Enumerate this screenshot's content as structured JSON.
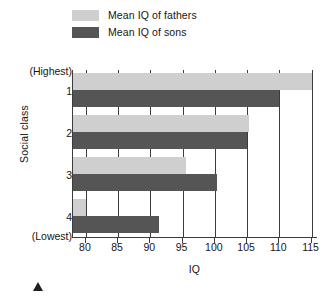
{
  "chart_data": {
    "type": "bar",
    "orientation": "horizontal",
    "title": "",
    "xlabel": "IQ",
    "ylabel": "Social class",
    "xlim": [
      78,
      116
    ],
    "xticks": [
      80,
      85,
      90,
      95,
      100,
      105,
      110,
      115
    ],
    "grid": true,
    "grid_axis": "x",
    "legend_position": "top-left",
    "categories": [
      "1",
      "2",
      "3",
      "4"
    ],
    "category_extra_labels": {
      "top": "(Highest)",
      "bottom": "(Lowest)"
    },
    "series": [
      {
        "name": "Mean IQ of fathers",
        "color": "#cfcfcf",
        "values": [
          115.0,
          105.3,
          95.5,
          80.0
        ]
      },
      {
        "name": "Mean IQ of sons",
        "color": "#555555",
        "values": [
          110.0,
          105.0,
          100.4,
          91.3
        ]
      }
    ]
  },
  "legend": {
    "items": [
      {
        "label": "Mean IQ of fathers",
        "color": "#cfcfcf"
      },
      {
        "label": "Mean IQ of sons",
        "color": "#555555"
      }
    ]
  },
  "axes": {
    "x": {
      "title": "IQ",
      "ticks": [
        "80",
        "85",
        "90",
        "95",
        "100",
        "105",
        "110",
        "115"
      ]
    },
    "y": {
      "title": "Social class",
      "ticks": [
        "(Highest)",
        "1",
        "2",
        "3",
        "4",
        "(Lowest)"
      ]
    }
  }
}
